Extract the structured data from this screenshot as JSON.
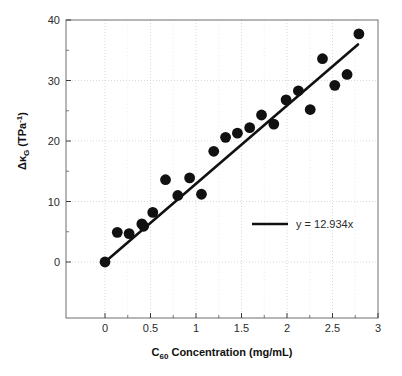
{
  "chart_data": {
    "type": "scatter",
    "title": "",
    "xlabel_parts": {
      "pre": "C",
      "sub": "60",
      "post": " Concentration (mg/mL)"
    },
    "xlabel": "C60 Concentration (mg/mL)",
    "ylabel_parts": {
      "delta": "Δ",
      "kappa": "κ",
      "sub": "G",
      "unit_pre": " (TPa",
      "unit_sup": "-1",
      "unit_post": ")"
    },
    "ylabel": "ΔκG (TPa-1)",
    "xlim": [
      0,
      3
    ],
    "ylim": [
      0,
      40
    ],
    "xticks": [
      "0",
      "0.5",
      "1",
      "1.5",
      "2",
      "2.5",
      "3"
    ],
    "xtick_values": [
      0,
      0.5,
      1,
      1.5,
      2,
      2.5,
      3
    ],
    "yticks": [
      "0",
      "10",
      "20",
      "30",
      "40"
    ],
    "ytick_values": [
      0,
      10,
      20,
      30,
      40
    ],
    "minor_xticks": [
      0.25,
      0.75,
      1.25,
      1.75,
      2.25,
      2.75
    ],
    "minor_yticks": [
      5,
      15,
      25,
      35
    ],
    "grid": true,
    "grid_style": "dotted",
    "grid_color": "#cfcfcf",
    "marker": "filled-circle",
    "marker_color": "#111111",
    "marker_size": 5.4,
    "series": [
      {
        "name": "measured",
        "points": [
          [
            0.0,
            0.0
          ],
          [
            0.135,
            4.9
          ],
          [
            0.265,
            4.7
          ],
          [
            0.405,
            6.3
          ],
          [
            0.425,
            5.9
          ],
          [
            0.525,
            8.2
          ],
          [
            0.665,
            13.6
          ],
          [
            0.8,
            11.0
          ],
          [
            0.93,
            13.9
          ],
          [
            1.06,
            11.2
          ],
          [
            1.195,
            18.3
          ],
          [
            1.325,
            20.6
          ],
          [
            1.455,
            21.3
          ],
          [
            1.59,
            22.2
          ],
          [
            1.72,
            24.3
          ],
          [
            1.855,
            22.8
          ],
          [
            1.99,
            26.8
          ],
          [
            2.125,
            28.3
          ],
          [
            2.255,
            25.2
          ],
          [
            2.39,
            33.6
          ],
          [
            2.525,
            29.2
          ],
          [
            2.66,
            31.0
          ],
          [
            2.79,
            37.7
          ]
        ]
      }
    ],
    "fit_line": {
      "label": "y = 12.934x",
      "slope": 12.934,
      "intercept": 0,
      "color": "#111111",
      "width": 2.6,
      "x_start": 0.0,
      "x_end": 2.78
    },
    "legend": {
      "position": "center-right",
      "entries": [
        {
          "label": "y = 12.934x",
          "type": "line",
          "color": "#111111"
        }
      ]
    },
    "axes_color": "#6e6e6e",
    "background": "#ffffff"
  }
}
